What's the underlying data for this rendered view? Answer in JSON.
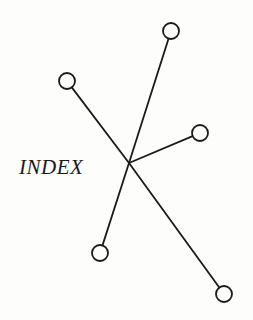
{
  "diagram": {
    "label": "INDEX",
    "hub": {
      "x": 129,
      "y": 163
    },
    "node_radius": 8,
    "stroke_color": "#1a1a1a",
    "nodes": [
      {
        "name": "top",
        "x": 171,
        "y": 31
      },
      {
        "name": "upper-left",
        "x": 67,
        "y": 81
      },
      {
        "name": "right",
        "x": 200,
        "y": 133
      },
      {
        "name": "bottom-left",
        "x": 100,
        "y": 253
      },
      {
        "name": "bottom-right",
        "x": 224,
        "y": 294
      }
    ]
  }
}
